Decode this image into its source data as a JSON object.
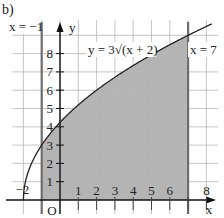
{
  "figure": {
    "label": "b)"
  },
  "chart_data": {
    "type": "area",
    "title": "",
    "function_label": "y = 3√(x + 2)",
    "function": "y = 3*sqrt(x+2)",
    "xlabel": "x",
    "ylabel": "y",
    "origin_label": "O",
    "x_ticks": [
      1,
      2,
      3,
      4,
      5,
      6,
      8
    ],
    "x_tick_labels": [
      "1",
      "2",
      "3",
      "4",
      "5",
      "6",
      "8"
    ],
    "x_extra_label": "−2",
    "y_ticks": [
      1,
      2,
      3,
      4,
      5,
      6,
      7,
      8
    ],
    "y_tick_labels": [
      "1",
      "2",
      "3",
      "4",
      "5",
      "6",
      "7",
      "8"
    ],
    "vertical_lines": [
      {
        "x": -1,
        "label": "x = −1"
      },
      {
        "x": 7,
        "label": "x = 7"
      }
    ],
    "shaded_region": {
      "from_x": -1,
      "to_x": 7,
      "under": "y = 3√(x + 2)",
      "above": "x-axis"
    },
    "curve_points": [
      {
        "x": -2,
        "y": 0
      },
      {
        "x": -1,
        "y": 3
      },
      {
        "x": 0,
        "y": 4.24
      },
      {
        "x": 1,
        "y": 5.2
      },
      {
        "x": 2,
        "y": 6
      },
      {
        "x": 3,
        "y": 6.71
      },
      {
        "x": 4,
        "y": 7.35
      },
      {
        "x": 5,
        "y": 7.94
      },
      {
        "x": 6,
        "y": 8.49
      },
      {
        "x": 7,
        "y": 9
      },
      {
        "x": 8,
        "y": 9.49
      }
    ],
    "xlim": [
      -2.5,
      8.6
    ],
    "ylim": [
      0,
      9.8
    ],
    "grid": true,
    "colors": {
      "shade": "#b4b4b4",
      "grid": "#b8b8b8",
      "curve": "#222222",
      "axis": "#111111",
      "boundary": "#6e6e6e"
    }
  }
}
